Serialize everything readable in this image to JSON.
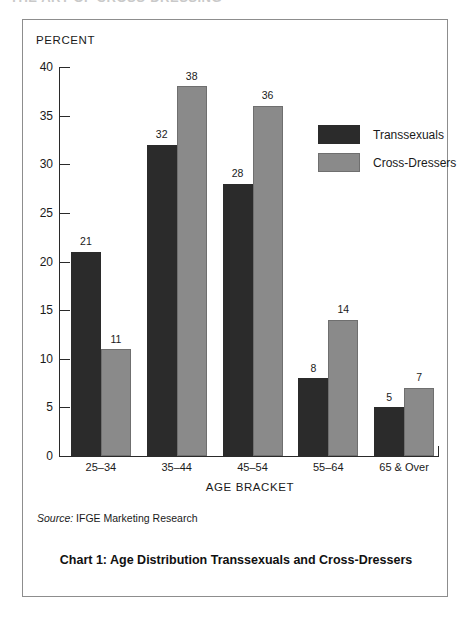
{
  "page": {
    "cropped_header_text": "THE ART OF CROSS-DRESSING"
  },
  "figure": {
    "y_axis_title": "PERCENT",
    "x_axis_title": "AGE BRACKET",
    "source_prefix": "Source:",
    "source_text": "IFGE Marketing Research",
    "caption": "Chart 1: Age Distribution Transsexuals and Cross-Dressers"
  },
  "legend": {
    "position": "inside-top-right",
    "items": [
      {
        "label": "Transsexuals",
        "color": "#2b2b2b"
      },
      {
        "label": "Cross-Dressers",
        "color": "#8a8a8a"
      }
    ]
  },
  "chart_data": {
    "type": "bar",
    "title": "Chart 1: Age Distribution Transsexuals and Cross-Dressers",
    "xlabel": "AGE BRACKET",
    "ylabel": "PERCENT",
    "categories": [
      "25–34",
      "35–44",
      "45–54",
      "55–64",
      "65 & Over"
    ],
    "series": [
      {
        "name": "Transsexuals",
        "color": "#2b2b2b",
        "values": [
          21,
          32,
          28,
          8,
          5
        ]
      },
      {
        "name": "Cross-Dressers",
        "color": "#8a8a8a",
        "values": [
          11,
          38,
          36,
          14,
          7
        ]
      }
    ],
    "ylim": [
      0,
      40
    ],
    "yticks": [
      0,
      5,
      10,
      15,
      20,
      25,
      30,
      35,
      40
    ],
    "ytick_labels": [
      "0",
      "5",
      "10",
      "15",
      "20",
      "25",
      "30",
      "35",
      "40"
    ],
    "grid": false,
    "data_labels": true,
    "legend_position": "inside-top-right",
    "source": "Source: IFGE Marketing Research"
  }
}
